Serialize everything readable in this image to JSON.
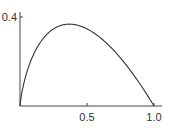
{
  "chart_data": {
    "type": "line",
    "title": "",
    "xlabel": "",
    "ylabel": "",
    "xlim": [
      0,
      1.0
    ],
    "ylim": [
      0,
      0.4
    ],
    "grid": false,
    "legend": "none",
    "x_ticks": [
      {
        "value": 0.5,
        "label": "0.5"
      },
      {
        "value": 1.0,
        "label": "1.0"
      }
    ],
    "y_ticks": [
      {
        "value": 0.4,
        "label": "0.4"
      }
    ],
    "series": [
      {
        "name": "curve",
        "function": "-x*ln(x)",
        "x": [
          0,
          0.02,
          0.05,
          0.1,
          0.15,
          0.2,
          0.25,
          0.3,
          0.368,
          0.4,
          0.5,
          0.6,
          0.7,
          0.8,
          0.9,
          0.95,
          1.0
        ],
        "y": [
          0,
          0.078,
          0.15,
          0.23,
          0.285,
          0.322,
          0.347,
          0.361,
          0.368,
          0.367,
          0.347,
          0.306,
          0.25,
          0.179,
          0.095,
          0.049,
          0
        ]
      }
    ]
  }
}
